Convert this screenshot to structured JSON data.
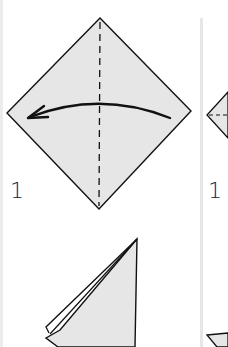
{
  "diagram": {
    "type": "origami-instructions",
    "colors": {
      "paper": "#e6e6e6",
      "stroke": "#111111",
      "background": "#ffffff",
      "divider": "#e6e6e6"
    },
    "panels": [
      {
        "step_label": "1",
        "description": "Square diamond with vertical dashed valley fold; curved arrow folding right half to the left"
      },
      {
        "step_label": "1",
        "description": "Partially visible diamond with horizontal dashed fold"
      }
    ],
    "lower_panel": {
      "description": "Folded triangle result (right-angled, with layered left edge)"
    }
  }
}
